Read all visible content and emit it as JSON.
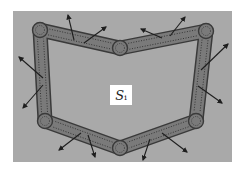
{
  "diagram": {
    "label": {
      "main": "S",
      "subscript": "i"
    },
    "colors": {
      "panel": "#a9a9a9",
      "rod_fill": "#7a7a7a",
      "rod_stroke": "#3a3a3a",
      "dots": "#2e2e2e",
      "arrow": "#1e1e1e",
      "label_bg": "#ffffff"
    },
    "panel": {
      "x": 13,
      "y": 11,
      "width": 219,
      "height": 151
    },
    "nodes": [
      {
        "id": "n1",
        "x": 40,
        "y": 30
      },
      {
        "id": "n2",
        "x": 120,
        "y": 48
      },
      {
        "id": "n3",
        "x": 206,
        "y": 31
      },
      {
        "id": "n4",
        "x": 196,
        "y": 121
      },
      {
        "id": "n5",
        "x": 120,
        "y": 148
      },
      {
        "id": "n6",
        "x": 45,
        "y": 121
      }
    ],
    "arrows": [
      {
        "x1": 74,
        "y1": 40,
        "x2": 68,
        "y2": 15
      },
      {
        "x1": 84,
        "y1": 43,
        "x2": 106,
        "y2": 27
      },
      {
        "x1": 162,
        "y1": 38,
        "x2": 141,
        "y2": 29
      },
      {
        "x1": 170,
        "y1": 36,
        "x2": 185,
        "y2": 17
      },
      {
        "x1": 201,
        "y1": 70,
        "x2": 228,
        "y2": 44
      },
      {
        "x1": 198,
        "y1": 86,
        "x2": 222,
        "y2": 103
      },
      {
        "x1": 43,
        "y1": 78,
        "x2": 19,
        "y2": 57
      },
      {
        "x1": 43,
        "y1": 85,
        "x2": 23,
        "y2": 108
      },
      {
        "x1": 81,
        "y1": 133,
        "x2": 59,
        "y2": 150
      },
      {
        "x1": 88,
        "y1": 135,
        "x2": 95,
        "y2": 157
      },
      {
        "x1": 150,
        "y1": 139,
        "x2": 143,
        "y2": 160
      },
      {
        "x1": 162,
        "y1": 133,
        "x2": 187,
        "y2": 152
      }
    ]
  }
}
